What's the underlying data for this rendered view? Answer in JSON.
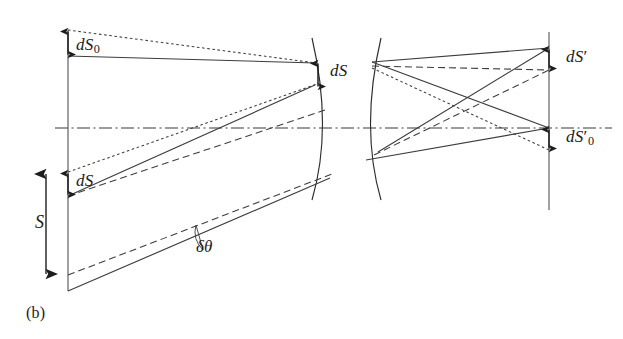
{
  "figure": {
    "panel_label": "(b)",
    "colors": {
      "ink": "#2b2b2b",
      "axis": "#3a3a3a",
      "background": "#ffffff"
    },
    "labels": {
      "dS0": {
        "base": "dS",
        "subscript": "0",
        "prime": ""
      },
      "dS_object": {
        "base": "dS",
        "subscript": "",
        "prime": ""
      },
      "S": {
        "base": "S",
        "subscript": "",
        "prime": ""
      },
      "dS_lens": {
        "base": "dS",
        "subscript": "",
        "prime": ""
      },
      "dS_prime": {
        "base": "dS",
        "subscript": "",
        "prime": "′"
      },
      "dS_prime_0": {
        "base": "dS",
        "subscript": "0",
        "prime": "′"
      },
      "delta_theta": {
        "base": "δθ",
        "subscript": "",
        "prime": ""
      }
    },
    "geometry": {
      "optical_axis_y": 128,
      "optical_axis_x_start": 55,
      "optical_axis_x_end": 612,
      "object_plane_x": 68,
      "object_plane_y_top": 30,
      "object_plane_y_bottom": 291,
      "image_plane_x": 549,
      "image_plane_y_top": 32,
      "image_plane_y_bottom": 210,
      "lens_front_vertex_x": 321,
      "lens_back_vertex_x": 372,
      "lens_top_y": 38,
      "lens_bottom_y": 200,
      "dS0_arrow": {
        "x": 68,
        "y_top": 30,
        "y_bottom": 56
      },
      "dS_object_arrow": {
        "x": 68,
        "y_top": 172,
        "y_bottom": 196
      },
      "S_arrow": {
        "x": 46,
        "y_top": 172,
        "y_bottom": 276
      },
      "dS_lens_arrow": {
        "x": 318,
        "y_top": 62,
        "y_bottom": 88
      },
      "dS_prime_arrow": {
        "x": 549,
        "y_top": 48,
        "y_bottom": 70
      },
      "dS_prime_0_arrow": {
        "x": 549,
        "y_top": 128,
        "y_bottom": 150
      }
    }
  }
}
